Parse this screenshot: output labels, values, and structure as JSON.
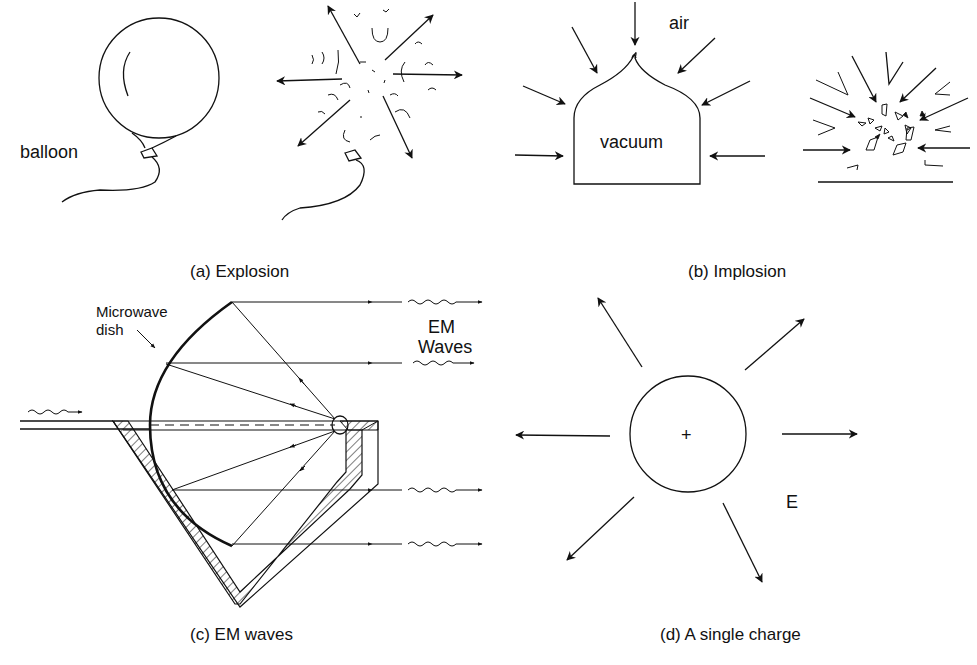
{
  "figure": {
    "panels": [
      {
        "id": "a",
        "caption": "(a) Explosion",
        "labels": {
          "balloon": "balloon"
        }
      },
      {
        "id": "b",
        "caption": "(b) Implosion",
        "labels": {
          "air": "air",
          "vacuum": "vacuum"
        }
      },
      {
        "id": "c",
        "caption": "(c) EM waves",
        "labels": {
          "dish_line1": "Microwave",
          "dish_line2": "dish",
          "waves_line1": "EM",
          "waves_line2": "Waves"
        }
      },
      {
        "id": "d",
        "caption": "(d) A single charge",
        "labels": {
          "charge": "+",
          "field": "E"
        }
      }
    ]
  }
}
